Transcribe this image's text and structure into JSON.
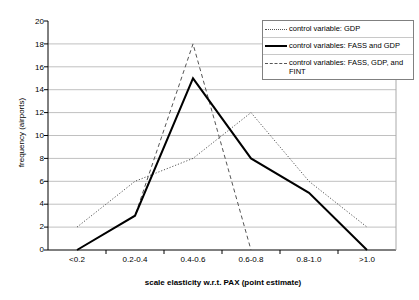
{
  "chart_data": {
    "type": "line",
    "title": "",
    "xlabel": "scale elasticity w.r.t. PAX (point estimate)",
    "ylabel": "frequency (airports)",
    "categories": [
      "<0.2",
      "0.2-0.4",
      "0.4-0.6",
      "0.6-0.8",
      "0.8-1.0",
      ">1.0"
    ],
    "ylim": [
      0,
      20
    ],
    "ytick_step": 2,
    "yticks": [
      "20",
      "18",
      "16",
      "14",
      "12",
      "10",
      "8",
      "6",
      "4",
      "2",
      "0"
    ],
    "grid": "horizontal",
    "legend_position": "top-right",
    "series": [
      {
        "name": "control variable: GDP",
        "style": "dotted",
        "color": "#555555",
        "values": [
          2,
          6,
          8,
          12,
          6,
          2
        ]
      },
      {
        "name": "control variables: FASS and GDP",
        "style": "solid",
        "color": "#000000",
        "values": [
          0,
          3,
          15,
          8,
          5,
          0
        ]
      },
      {
        "name": "control variables: FASS, GDP, and FINT",
        "style": "dashed",
        "color": "#555555",
        "values": [
          0,
          3,
          18,
          0,
          null,
          null
        ]
      }
    ]
  },
  "legend": {
    "items": [
      {
        "label": "control variable: GDP"
      },
      {
        "label": "control variables: FASS and GDP"
      },
      {
        "label": "control variables: FASS, GDP, and FINT"
      }
    ]
  },
  "colors": {
    "axis": "#000000",
    "grid": "#c0c0c0",
    "series_solid": "#000000",
    "series_dotted": "#555555",
    "series_dashed": "#555555",
    "background": "#ffffff"
  }
}
